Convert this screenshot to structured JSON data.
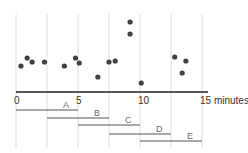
{
  "chart_data": {
    "type": "scatter",
    "title": "",
    "xlabel": "minutes",
    "ylabel": "",
    "xlim": [
      0,
      15.5
    ],
    "x_ticks": [
      0,
      5,
      10,
      15
    ],
    "x_tick_labels": [
      "0",
      "5",
      "10",
      "15 minutes"
    ],
    "gridlines_x": [
      0,
      2.5,
      5,
      7.5,
      10,
      12.5,
      15
    ],
    "grid": true,
    "legend": "none",
    "series": [
      {
        "name": "events",
        "points": [
          {
            "x": 0.4,
            "y": 26
          },
          {
            "x": 0.9,
            "y": 34
          },
          {
            "x": 1.3,
            "y": 30
          },
          {
            "x": 2.3,
            "y": 30
          },
          {
            "x": 3.9,
            "y": 26
          },
          {
            "x": 4.8,
            "y": 34
          },
          {
            "x": 5.1,
            "y": 29
          },
          {
            "x": 6.6,
            "y": 15
          },
          {
            "x": 7.5,
            "y": 30
          },
          {
            "x": 8.0,
            "y": 31
          },
          {
            "x": 9.2,
            "y": 70
          },
          {
            "x": 9.2,
            "y": 58
          },
          {
            "x": 10.1,
            "y": 9
          },
          {
            "x": 12.8,
            "y": 35
          },
          {
            "x": 13.4,
            "y": 19
          },
          {
            "x": 13.7,
            "y": 31
          }
        ]
      }
    ],
    "windows": [
      {
        "label": "A",
        "start": 0,
        "end": 5
      },
      {
        "label": "B",
        "start": 2.5,
        "end": 7.5
      },
      {
        "label": "C",
        "start": 5,
        "end": 10
      },
      {
        "label": "D",
        "start": 7.5,
        "end": 12.5
      },
      {
        "label": "E",
        "start": 10,
        "end": 15
      }
    ],
    "colors": {
      "points": "#404040",
      "axis": "#222222",
      "grid": "#d8d8d8",
      "windows": "#555555"
    }
  }
}
